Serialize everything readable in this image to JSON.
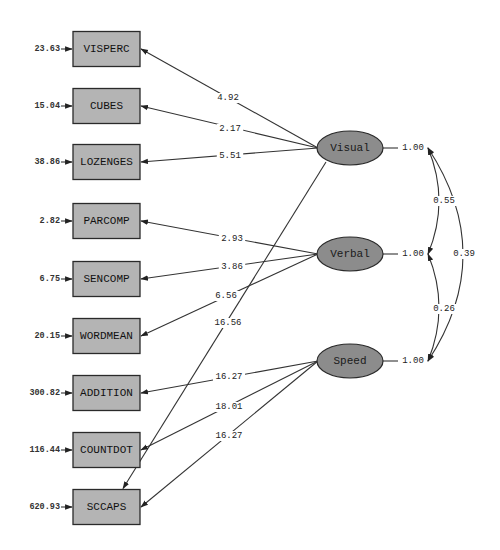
{
  "diagram": {
    "type": "structural-equation-path-diagram",
    "observed": [
      {
        "name": "VISPERC",
        "error": "23.63",
        "y": 49
      },
      {
        "name": "CUBES",
        "error": "15.04",
        "y": 106
      },
      {
        "name": "LOZENGES",
        "error": "38.86",
        "y": 162
      },
      {
        "name": "PARCOMP",
        "error": "2.82",
        "y": 221
      },
      {
        "name": "SENCOMP",
        "error": "6.75",
        "y": 279
      },
      {
        "name": "WORDMEAN",
        "error": "20.15",
        "y": 336
      },
      {
        "name": "ADDITION",
        "error": "300.82",
        "y": 393
      },
      {
        "name": "COUNTDOT",
        "error": "116.44",
        "y": 450
      },
      {
        "name": "SCCAPS",
        "error": "620.93",
        "y": 507
      }
    ],
    "latent": [
      {
        "name": "Visual",
        "variance": "1.00",
        "y": 148
      },
      {
        "name": "Verbal",
        "variance": "1.00",
        "y": 254
      },
      {
        "name": "Speed",
        "variance": "1.00",
        "y": 361
      }
    ],
    "loadings": [
      {
        "from": "Visual",
        "to": "VISPERC",
        "value": "4.92",
        "lx": 228,
        "ly": 98
      },
      {
        "from": "Visual",
        "to": "CUBES",
        "value": "2.17",
        "lx": 230,
        "ly": 129
      },
      {
        "from": "Visual",
        "to": "LOZENGES",
        "value": "5.51",
        "lx": 230,
        "ly": 156
      },
      {
        "from": "Visual",
        "to": "SCCAPS",
        "value": "16.56",
        "lx": 228,
        "ly": 323
      },
      {
        "from": "Verbal",
        "to": "PARCOMP",
        "value": "2.93",
        "lx": 232,
        "ly": 239
      },
      {
        "from": "Verbal",
        "to": "SENCOMP",
        "value": "3.86",
        "lx": 232,
        "ly": 267
      },
      {
        "from": "Verbal",
        "to": "WORDMEAN",
        "value": "6.56",
        "lx": 226,
        "ly": 296
      },
      {
        "from": "Speed",
        "to": "ADDITION",
        "value": "16.27",
        "lx": 229,
        "ly": 377
      },
      {
        "from": "Speed",
        "to": "COUNTDOT",
        "value": "18.01",
        "lx": 229,
        "ly": 407
      },
      {
        "from": "Speed",
        "to": "SCCAPS",
        "value": "16.27",
        "lx": 229,
        "ly": 436
      }
    ],
    "covariances": [
      {
        "between": [
          "Visual",
          "Verbal"
        ],
        "value": "0.55",
        "lx": 444,
        "ly": 201
      },
      {
        "between": [
          "Verbal",
          "Speed"
        ],
        "value": "0.26",
        "lx": 444,
        "ly": 309
      },
      {
        "between": [
          "Visual",
          "Speed"
        ],
        "value": "0.39",
        "lx": 464,
        "ly": 254
      }
    ]
  }
}
